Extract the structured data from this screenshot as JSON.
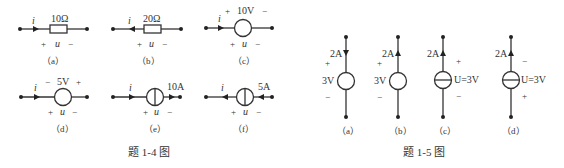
{
  "figure_1_4": {
    "caption": "题 1-4 图",
    "panels": [
      {
        "id": "a",
        "label": "（a）",
        "element": "resistor",
        "value": "10Ω",
        "current": "i",
        "current_dir": "right",
        "voltage": "u",
        "plus": "+",
        "minus": "−"
      },
      {
        "id": "b",
        "label": "（b）",
        "element": "resistor",
        "value": "20Ω",
        "current": "i",
        "current_dir": "left",
        "voltage": "u",
        "plus": "+",
        "minus": "−"
      },
      {
        "id": "c",
        "label": "（c）",
        "element": "voltage-source",
        "value": "10V",
        "src_plus": "+",
        "src_minus": "−",
        "current": "i",
        "current_dir": "right",
        "voltage": "u",
        "plus": "+",
        "minus": "−"
      },
      {
        "id": "d",
        "label": "（d）",
        "element": "voltage-source",
        "value": "5V",
        "src_minus": "−",
        "src_plus": "+",
        "current": "i",
        "current_dir": "right",
        "voltage": "u",
        "plus": "+",
        "minus": "−"
      },
      {
        "id": "e",
        "label": "（e）",
        "element": "current-source",
        "value": "10A",
        "source_dir": "right",
        "current": "i",
        "current_dir": "right",
        "voltage": "u",
        "plus": "+",
        "minus": "−"
      },
      {
        "id": "f",
        "label": "（f）",
        "element": "current-source",
        "value": "5A",
        "source_dir": "left",
        "current": "i",
        "current_dir": "left",
        "voltage": "u",
        "plus": "+",
        "minus": "−"
      }
    ]
  },
  "figure_1_5": {
    "caption": "题 1-5 图",
    "panels": [
      {
        "id": "a",
        "label": "（a）",
        "current": "2A",
        "current_dir": "down",
        "value": "3V",
        "top_sign": "+",
        "bottom_sign": "−"
      },
      {
        "id": "b",
        "label": "（b）",
        "current": "2A",
        "current_dir": "up",
        "value": "3V",
        "top_sign": "+",
        "bottom_sign": "−"
      },
      {
        "id": "c",
        "label": "（c）",
        "current": "2A",
        "current_dir": "up",
        "value": "U=3V",
        "top_sign": "+",
        "bottom_sign": "−"
      },
      {
        "id": "d",
        "label": "（d）",
        "current": "2A",
        "current_dir": "up",
        "value": "U=3V",
        "top_sign": "−",
        "bottom_sign": "+"
      }
    ]
  }
}
